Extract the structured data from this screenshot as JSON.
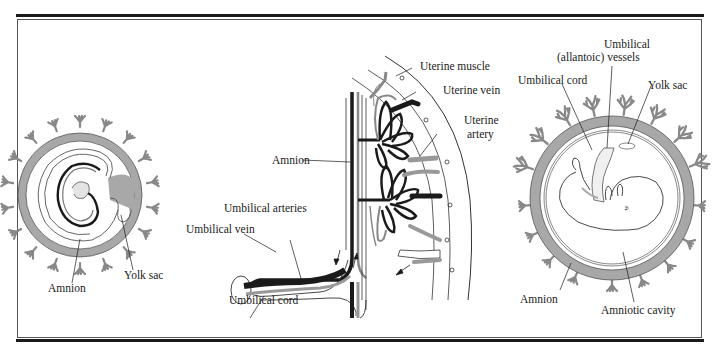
{
  "figure": {
    "panels": [
      {
        "id": "early-embryo",
        "labels": {
          "amnion": "Amnion",
          "yolk_sac": "Yolk sac"
        }
      },
      {
        "id": "placenta-detail",
        "labels": {
          "uterine_muscle": "Uterine muscle",
          "uterine_vein": "Uterine vein",
          "uterine_artery_line1": "Uterine",
          "uterine_artery_line2": "artery",
          "amnion": "Amnion",
          "umbilical_arteries": "Umbilical arteries",
          "umbilical_vein": "Umbilical vein",
          "umbilical_cord": "Umbilical cord"
        }
      },
      {
        "id": "later-fetus",
        "labels": {
          "umbilical_vessels_line1": "Umbilical",
          "umbilical_vessels_line2": "(allantoic) vessels",
          "umbilical_cord": "Umbilical cord",
          "yolk_sac": "Yolk sac",
          "amnion": "Amnion",
          "amniotic_cavity": "Amniotic cavity"
        }
      }
    ],
    "colors": {
      "ink": "#1a1a1a",
      "tissue_gray": "#a8a8a8",
      "light_gray": "#c8c8c8",
      "background": "#ffffff"
    }
  }
}
